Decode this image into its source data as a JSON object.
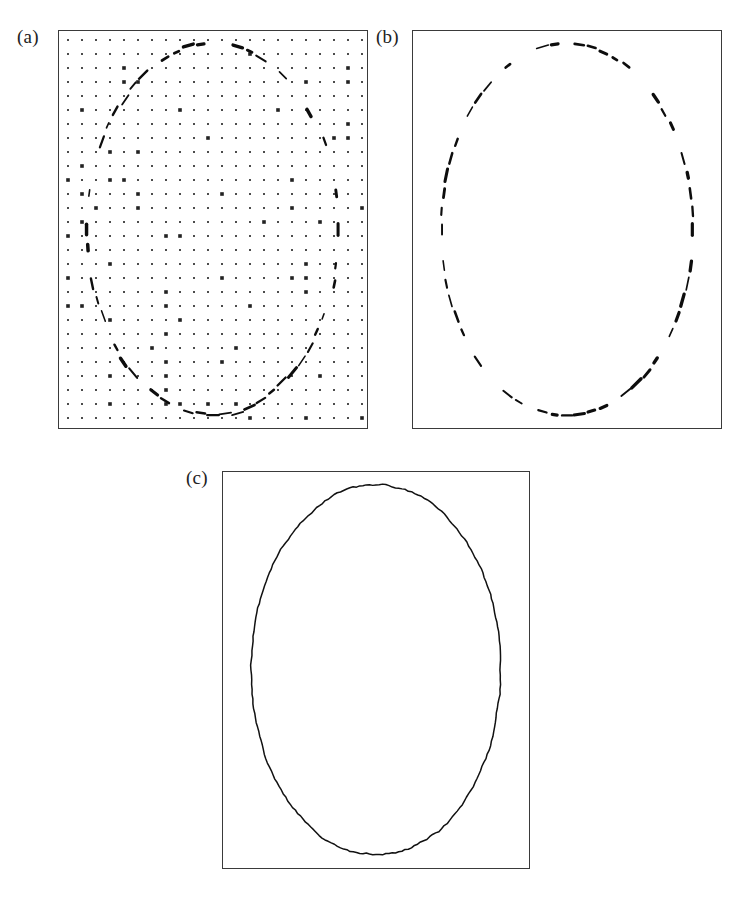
{
  "figure": {
    "background_color": "#ffffff",
    "ink_color": "#111111",
    "frame_color": "#3a3a3a",
    "width": 749,
    "height": 897
  },
  "panels": [
    {
      "id": "a",
      "label": "(a)",
      "caption_text": "(a)",
      "content_type": "grid-with-edge-points",
      "frame": {
        "x": 58,
        "y": 30,
        "width": 310,
        "height": 399
      },
      "label_position": {
        "x": 17,
        "y": 27
      },
      "grid": {
        "visible": true,
        "dot_color": "#222222",
        "dot_radius": 0.9,
        "spacing_x": 14,
        "spacing_y": 14,
        "origin_x": 10,
        "origin_y": 10,
        "cols": 22,
        "rows": 28
      },
      "edge_fragments_visible": true
    },
    {
      "id": "b",
      "label": "(b)",
      "caption_text": "(b)",
      "content_type": "dashed-edge-fragments",
      "frame": {
        "x": 412,
        "y": 30,
        "width": 310,
        "height": 399
      },
      "label_position": {
        "x": 376,
        "y": 27
      },
      "grid": {
        "visible": false
      },
      "edge_fragments_visible": true
    },
    {
      "id": "c",
      "label": "(c)",
      "caption_text": "(c)",
      "content_type": "closed-contour",
      "frame": {
        "x": 222,
        "y": 471,
        "width": 308,
        "height": 398
      },
      "label_position": {
        "x": 186,
        "y": 468
      },
      "grid": {
        "visible": false
      },
      "edge_fragments_visible": false,
      "contour_closed": true
    }
  ],
  "chart_data": {
    "type": "scatter",
    "xlabel": "",
    "ylabel": "",
    "grid": true,
    "legend": "none",
    "xlim": [
      0,
      310
    ],
    "ylim": [
      0,
      399
    ],
    "ellipse": {
      "center_x": 0.5,
      "center_y": 0.5,
      "semi_axis_x": 0.405,
      "semi_axis_y": 0.465,
      "note": "fractions of panel width/height"
    },
    "series": [
      {
        "name": "edge fragments (tangential dashes)",
        "type": "dash-segments-along-ellipse",
        "count": 64,
        "angles_deg": [
          0,
          5.6,
          11.3,
          16.9,
          22.5,
          28.1,
          33.8,
          39.4,
          45,
          50.6,
          56.3,
          61.9,
          67.5,
          73.1,
          78.8,
          84.4,
          90,
          95.6,
          101.3,
          106.9,
          112.5,
          118.1,
          123.8,
          129.4,
          135,
          140.6,
          146.3,
          151.9,
          157.5,
          163.1,
          168.8,
          174.4,
          180,
          185.6,
          191.3,
          196.9,
          202.5,
          208.1,
          213.8,
          219.4,
          225,
          230.6,
          236.3,
          241.9,
          247.5,
          253.1,
          258.8,
          264.4,
          270,
          275.6,
          281.3,
          286.9,
          292.5,
          298.1,
          303.8,
          309.4,
          315,
          320.6,
          326.3,
          331.9,
          337.5,
          343.1,
          348.8,
          354.4
        ],
        "dash_length_px": 11,
        "dash_width_px": 2.2
      },
      {
        "name": "closed contour",
        "type": "polyline",
        "point_count": 240,
        "closed": true,
        "stroke_width_px": 1.5
      }
    ]
  }
}
